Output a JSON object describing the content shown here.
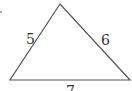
{
  "diagram": {
    "type": "triangle",
    "sides": [
      {
        "label": "5",
        "position": "left"
      },
      {
        "label": "6",
        "position": "right"
      },
      {
        "label": "7",
        "position": "bottom"
      }
    ],
    "stroke_color": "#555555"
  }
}
